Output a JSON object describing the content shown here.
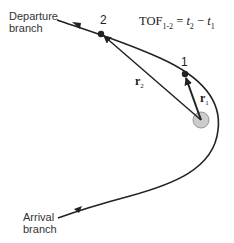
{
  "diagram": {
    "type": "orbital-transfer-hyperbolic",
    "labels": {
      "departure": [
        "Departure",
        "branch"
      ],
      "arrival": [
        "Arrival",
        "branch"
      ],
      "point1": "1",
      "point2": "2",
      "r1": "r",
      "r1_sub": "1",
      "r2": "r",
      "r2_sub": "2"
    },
    "equation": {
      "lhs": "TOF",
      "lhs_sub": "1-2",
      "eq": " = ",
      "t2": "t",
      "t2_sub": "2",
      "minus": " − ",
      "t1": "t",
      "t1_sub": "1"
    },
    "colors": {
      "line": "#222222",
      "focus_fill": "#cccccc",
      "focus_stroke": "#999999",
      "text": "#333333"
    }
  }
}
